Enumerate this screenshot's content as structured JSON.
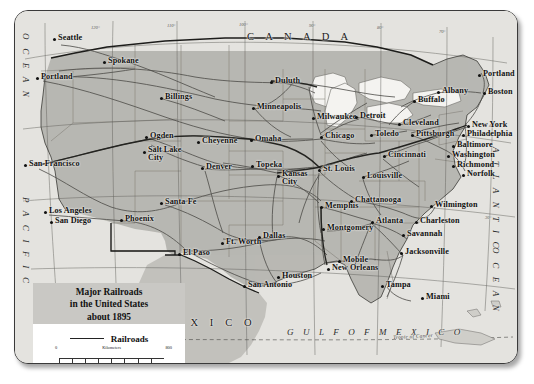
{
  "title_block": {
    "line1": "Major Railroads",
    "line2": "in the United States",
    "line3": "about 1895",
    "legend_label": "Railroads",
    "scale": {
      "km_label": "Kilometers",
      "km_min": "0",
      "km_max": "800",
      "mi_label": "Miles",
      "mi_min": "0",
      "mi_max": "500"
    }
  },
  "regions": {
    "canada": "C A N A D A",
    "mexico": "M E X I C O",
    "gulf": "G U L F   O F   M E X I C O",
    "pacific_ocean_top": "O C E A N",
    "pacific_ocean_bottom": "P A C I F I C",
    "atlantic_top": "A T L A N T I C",
    "atlantic_bottom": "O C E A N",
    "tropic": "Tropic of Cancer"
  },
  "graticule_labels": [
    "120°",
    "110°",
    "100°",
    "90°",
    "80°",
    "70°",
    "40°",
    "30°"
  ],
  "cities": [
    {
      "name": "Seattle",
      "x": 38,
      "y": 26
    },
    {
      "name": "Spokane",
      "x": 88,
      "y": 49
    },
    {
      "name": "Portland",
      "x": 21,
      "y": 65
    },
    {
      "name": "Billings",
      "x": 145,
      "y": 85
    },
    {
      "name": "Duluth",
      "x": 255,
      "y": 69
    },
    {
      "name": "Minneapolis",
      "x": 237,
      "y": 95
    },
    {
      "name": "Milwaukee",
      "x": 297,
      "y": 105
    },
    {
      "name": "Detroit",
      "x": 340,
      "y": 104
    },
    {
      "name": "Chicago",
      "x": 305,
      "y": 124
    },
    {
      "name": "Toledo",
      "x": 355,
      "y": 122
    },
    {
      "name": "Cleveland",
      "x": 383,
      "y": 111
    },
    {
      "name": "Buffalo",
      "x": 398,
      "y": 88
    },
    {
      "name": "Albany",
      "x": 422,
      "y": 79
    },
    {
      "name": "Portland ME",
      "x": 463,
      "y": 62,
      "label": "Portland"
    },
    {
      "name": "Boston",
      "x": 468,
      "y": 80
    },
    {
      "name": "New York",
      "x": 452,
      "y": 113
    },
    {
      "name": "Pittsburgh",
      "x": 396,
      "y": 122
    },
    {
      "name": "Philadelphia",
      "x": 447,
      "y": 122
    },
    {
      "name": "Baltimore",
      "x": 437,
      "y": 133
    },
    {
      "name": "Washington",
      "x": 432,
      "y": 143
    },
    {
      "name": "Richmond",
      "x": 437,
      "y": 153
    },
    {
      "name": "Norfolk",
      "x": 447,
      "y": 162
    },
    {
      "name": "Cincinnati",
      "x": 368,
      "y": 143
    },
    {
      "name": "Ogden",
      "x": 130,
      "y": 124
    },
    {
      "name": "Salt Lake City",
      "x": 128,
      "y": 139,
      "two": true,
      "l1": "Salt Lake",
      "l2": "City"
    },
    {
      "name": "Cheyenne",
      "x": 182,
      "y": 129
    },
    {
      "name": "Omaha",
      "x": 235,
      "y": 127
    },
    {
      "name": "Denver",
      "x": 186,
      "y": 155
    },
    {
      "name": "Topeka",
      "x": 236,
      "y": 153
    },
    {
      "name": "Kansas City",
      "x": 262,
      "y": 163,
      "two": true,
      "l1": "Kansas",
      "l2": "City"
    },
    {
      "name": "St. Louis",
      "x": 303,
      "y": 157
    },
    {
      "name": "Louisville",
      "x": 347,
      "y": 164
    },
    {
      "name": "San Francisco",
      "x": 9,
      "y": 152
    },
    {
      "name": "Los Angeles",
      "x": 29,
      "y": 199
    },
    {
      "name": "San Diego",
      "x": 35,
      "y": 209
    },
    {
      "name": "Phoenix",
      "x": 105,
      "y": 207
    },
    {
      "name": "Santa Fe",
      "x": 145,
      "y": 190
    },
    {
      "name": "El Paso",
      "x": 163,
      "y": 241
    },
    {
      "name": "Ft. Worth",
      "x": 206,
      "y": 230
    },
    {
      "name": "Dallas",
      "x": 243,
      "y": 224
    },
    {
      "name": "Memphis",
      "x": 305,
      "y": 194
    },
    {
      "name": "Chattanooga",
      "x": 335,
      "y": 188
    },
    {
      "name": "Atlanta",
      "x": 356,
      "y": 209
    },
    {
      "name": "Montgomery",
      "x": 307,
      "y": 216
    },
    {
      "name": "Wilmington",
      "x": 415,
      "y": 193
    },
    {
      "name": "Charleston",
      "x": 400,
      "y": 209
    },
    {
      "name": "Savannah",
      "x": 387,
      "y": 222
    },
    {
      "name": "Jacksonville",
      "x": 385,
      "y": 240
    },
    {
      "name": "Mobile",
      "x": 323,
      "y": 248
    },
    {
      "name": "New Orleans",
      "x": 312,
      "y": 256
    },
    {
      "name": "Houston",
      "x": 262,
      "y": 264
    },
    {
      "name": "San Antonio",
      "x": 228,
      "y": 273
    },
    {
      "name": "Tampa",
      "x": 366,
      "y": 273
    },
    {
      "name": "Miami",
      "x": 406,
      "y": 285
    }
  ]
}
